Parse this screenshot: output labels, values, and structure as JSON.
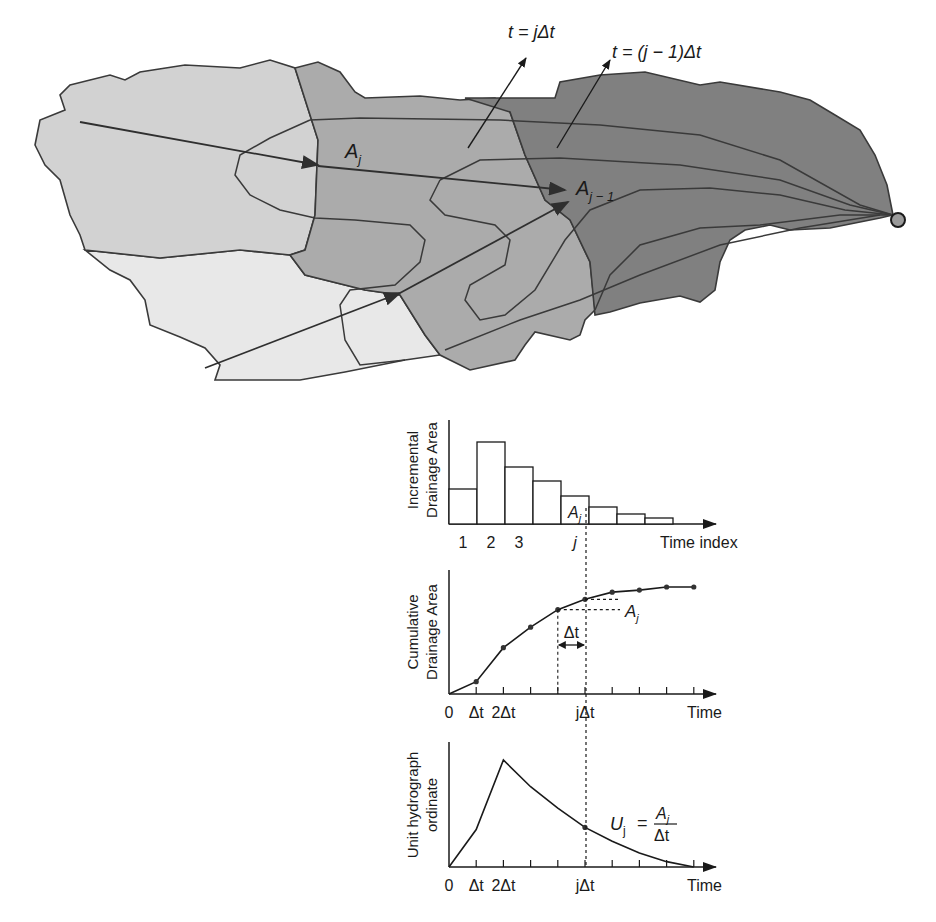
{
  "watershed": {
    "labels": {
      "isochrone_j": "t = jΔt",
      "isochrone_j_minus_1": "t = (j − 1)Δt",
      "area_j": "A",
      "area_j_sub": "j",
      "area_j_minus_1": "A",
      "area_j_minus_1_sub": "j − 1"
    },
    "colors": {
      "zone_far": "#e6e6e6",
      "zone_mid_light": "#cfcfcf",
      "zone_mid": "#a9a9a9",
      "zone_near": "#7e7e7e",
      "outline": "#3a3a3a",
      "outlet": "#9a9a9a"
    }
  },
  "chart_data": [
    {
      "type": "bar",
      "title": "",
      "ylabel": "Incremental Drainage Area",
      "xlabel": "Time index",
      "tick_labels": [
        "1",
        "2",
        "3",
        "",
        "j",
        "",
        "",
        ""
      ],
      "categories": [
        "1",
        "2",
        "3",
        "4",
        "j",
        "6",
        "7",
        "8"
      ],
      "values": [
        35,
        82,
        57,
        43,
        28,
        17,
        10,
        6
      ],
      "highlight": {
        "index": 4,
        "label": "A",
        "sub": "j"
      },
      "grid": false
    },
    {
      "type": "line",
      "title": "",
      "ylabel": "Cumulative Drainage Area",
      "xlabel": "Time",
      "x_tick_labels": [
        "0",
        "Δt",
        "2Δt",
        "",
        "",
        "jΔt",
        "",
        "",
        "",
        ""
      ],
      "x": [
        0,
        1,
        2,
        3,
        4,
        5,
        6,
        7,
        8,
        9
      ],
      "values": [
        0,
        12,
        45,
        65,
        82,
        92,
        99,
        101,
        104,
        104
      ],
      "annotations": {
        "delta_t": "Δt",
        "increment": "A",
        "increment_sub": "j",
        "j_index": 5
      },
      "grid": false
    },
    {
      "type": "line",
      "title": "",
      "ylabel": "Unit hydrograph ordinate",
      "xlabel": "Time",
      "x_tick_labels": [
        "0",
        "Δt",
        "2Δt",
        "",
        "",
        "jΔt",
        "",
        "",
        "",
        ""
      ],
      "x": [
        0,
        1,
        2,
        3,
        4,
        5,
        6,
        7,
        8,
        9
      ],
      "values": [
        0,
        35,
        100,
        75,
        55,
        37,
        24,
        13,
        5,
        0
      ],
      "annotations": {
        "formula_lhs": "U",
        "formula_lhs_sub": "j",
        "formula_num": "A",
        "formula_num_sub": "j",
        "formula_den": "Δt",
        "equals": "=",
        "j_index": 5
      },
      "grid": false
    }
  ],
  "axis_labels": {
    "chart1_y_line1": "Incremental",
    "chart1_y_line2": "Drainage Area",
    "chart2_y_line1": "Cumulative",
    "chart2_y_line2": "Drainage Area",
    "chart3_y_line1": "Unit hydrograph",
    "chart3_y_line2": "ordinate"
  }
}
